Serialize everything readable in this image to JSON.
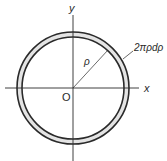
{
  "diagram": {
    "labels": {
      "y_axis": "y",
      "x_axis": "x",
      "origin": "O",
      "radius": "ρ",
      "ring_area": "2πρdρ"
    },
    "colors": {
      "stroke": "#2a2a2a",
      "ring_fill": "#e4e4e4",
      "background": "#ffffff"
    },
    "geometry": {
      "center": [
        73,
        88
      ],
      "outer_radius": 56,
      "inner_radius": 51
    }
  }
}
